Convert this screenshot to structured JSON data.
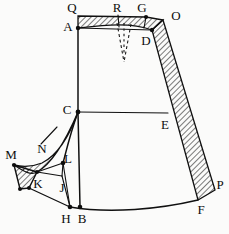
{
  "figure": {
    "type": "technical-line-drawing",
    "background_color": "#fbfbfa",
    "line_color": "#101010",
    "hatch_color": "#1a1a1a",
    "dart_style": "dashed"
  },
  "labels": {
    "Q": "Q",
    "R": "R",
    "G": "G",
    "O": "O",
    "A": "A",
    "D": "D",
    "C": "C",
    "E": "E",
    "M": "M",
    "N": "N",
    "L": "L",
    "K": "K",
    "J": "J",
    "H": "H",
    "B": "B",
    "F": "F",
    "P": "P"
  },
  "points": {
    "Q": {
      "x": 78,
      "y": 16,
      "label_x": 72,
      "label_y": 9,
      "dot": false
    },
    "R": {
      "x": 118,
      "y": 15,
      "label_x": 117,
      "label_y": 9,
      "dot": false
    },
    "G": {
      "x": 146,
      "y": 17,
      "label_x": 142,
      "label_y": 9,
      "dot": true
    },
    "O": {
      "x": 163,
      "y": 20,
      "label_x": 176,
      "label_y": 16,
      "dot": false
    },
    "A": {
      "x": 78,
      "y": 28,
      "label_x": 69,
      "label_y": 28,
      "dot": true
    },
    "D": {
      "x": 152,
      "y": 30,
      "label_x": 145,
      "label_y": 41,
      "dot": true
    },
    "C": {
      "x": 78,
      "y": 112,
      "label_x": 68,
      "label_y": 111,
      "dot": true
    },
    "E": {
      "x": 168,
      "y": 113,
      "label_x": 164,
      "label_y": 125,
      "dot": false
    },
    "M": {
      "x": 14,
      "y": 165,
      "label_x": 11,
      "label_y": 156,
      "dot": true
    },
    "N": {
      "x": 42,
      "y": 147,
      "label_x": 42,
      "label_y": 148,
      "dot": false
    },
    "L": {
      "x": 63,
      "y": 163,
      "label_x": 65,
      "label_y": 158,
      "dot": true
    },
    "K": {
      "x": 37,
      "y": 172,
      "label_x": 38,
      "label_y": 184,
      "dot": true
    },
    "J": {
      "x": 62,
      "y": 176,
      "label_x": 62,
      "label_y": 188,
      "dot": false
    },
    "H": {
      "x": 70,
      "y": 207,
      "label_x": 66,
      "label_y": 219,
      "dot": true
    },
    "B": {
      "x": 80,
      "y": 207,
      "label_x": 80,
      "label_y": 219,
      "dot": true
    },
    "F": {
      "x": 198,
      "y": 200,
      "label_x": 200,
      "label_y": 210,
      "dot": false
    },
    "P": {
      "x": 215,
      "y": 190,
      "label_x": 218,
      "label_y": 185,
      "dot": false
    }
  },
  "paths": {
    "waistband_outer_top": "M 78 16 L 146 17 L 163 20",
    "waistband_inner": "M 78 28 C 105 25 130 22 146 17",
    "a_to_d_line": "M 78 28 L 152 30",
    "center_front_A_C": "M 78 28 L 78 112",
    "center_front_C_B": "M 78 112 L 80 207",
    "waist_to_hip_CE": "M 78 112 L 168 113",
    "side_seam_outer": "M 163 20 L 215 190",
    "side_seam_inner": "M 152 30 L 198 200",
    "hem_curve": "M 70 207 C 110 214 160 209 198 200",
    "hem_left_to_K": "M 70 207 L 29 188",
    "hip_curve_outer": "M 78 112 C 68 140 56 156 42 163 C 32 167 22 167 14 165",
    "hip_curve_inner": "M 78 112 C 70 142 60 158 46 166 C 38 171 28 174 20 180",
    "C_to_L": "M 78 112 C 70 134 66 152 63 163",
    "L_to_J": "M 63 163 L 62 176",
    "L_to_K": "M 63 163 L 37 172",
    "L_to_H": "M 63 163 L 70 207",
    "J_to_H": "M 62 176 L 70 207",
    "K_to_J": "M 37 172 L 62 176",
    "K_to_M_edge": "M 37 172 L 14 165",
    "K_square_left": "M 14 165 L 20 189",
    "K_square_bottom": "M 20 189 L 29 188",
    "K_square_right": "M 37 172 L 29 188",
    "N_leader": "M 56 128 L 40 144",
    "dart_left": "M 117 22 L 124 62",
    "dart_right": "M 131 23 L 124 62",
    "dart_center": "M 124 22 L 124 55",
    "R_tick": "M 118 15 L 119 26",
    "G_tick": "M 146 17 L 144 28"
  },
  "hatch_regions": {
    "waistband": "M 78 16 L 146 17 L 163 20 L 152 30 C 130 22 105 25 78 28 Z",
    "side_band": "M 163 20 L 215 190 L 198 200 L 152 30 Z",
    "hip_strip": "M 78 112 C 68 140 56 156 42 163 C 32 167 22 167 14 165 C 22 170 30 176 37 172 C 52 164 66 140 78 112 Z",
    "K_block": "M 14 165 L 37 172 L 29 188 L 20 189 Z"
  }
}
